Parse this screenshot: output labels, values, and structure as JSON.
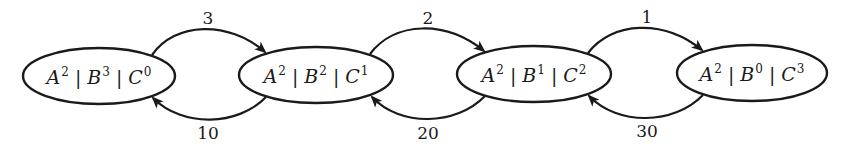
{
  "diagram": {
    "type": "state-transition-chain",
    "colors": {
      "stroke": "#1a1a1a",
      "background": "#ffffff"
    },
    "nodes": [
      {
        "id": "s0",
        "cx": 99,
        "cy": 76,
        "rx": 76,
        "ry": 28,
        "terms": [
          {
            "var": "A",
            "exp": "2"
          },
          {
            "var": "B",
            "exp": "3"
          },
          {
            "var": "C",
            "exp": "0"
          }
        ],
        "separator": "|"
      },
      {
        "id": "s1",
        "cx": 316,
        "cy": 75,
        "rx": 77,
        "ry": 28,
        "terms": [
          {
            "var": "A",
            "exp": "2"
          },
          {
            "var": "B",
            "exp": "2"
          },
          {
            "var": "C",
            "exp": "1"
          }
        ],
        "separator": "|"
      },
      {
        "id": "s2",
        "cx": 534,
        "cy": 74,
        "rx": 77,
        "ry": 28,
        "terms": [
          {
            "var": "A",
            "exp": "2"
          },
          {
            "var": "B",
            "exp": "1"
          },
          {
            "var": "C",
            "exp": "2"
          }
        ],
        "separator": "|"
      },
      {
        "id": "s3",
        "cx": 752,
        "cy": 73,
        "rx": 75,
        "ry": 28,
        "terms": [
          {
            "var": "A",
            "exp": "2"
          },
          {
            "var": "B",
            "exp": "0"
          },
          {
            "var": "C",
            "exp": "3"
          }
        ],
        "separator": "|"
      }
    ],
    "edges": [
      {
        "from": "s0",
        "to": "s1",
        "label": "3",
        "direction": "forward",
        "label_x": 208,
        "label_y": 18,
        "path": "M152,55 C175,22 228,20 265,52"
      },
      {
        "from": "s1",
        "to": "s0",
        "label": "10",
        "direction": "backward",
        "label_x": 208,
        "label_y": 133,
        "path": "M266,97 C238,126 183,128 153,98"
      },
      {
        "from": "s1",
        "to": "s2",
        "label": "2",
        "direction": "forward",
        "label_x": 428,
        "label_y": 18,
        "path": "M370,54 C395,21 446,20 484,51"
      },
      {
        "from": "s2",
        "to": "s1",
        "label": "20",
        "direction": "backward",
        "label_x": 428,
        "label_y": 133,
        "path": "M485,96 C456,126 400,127 372,97"
      },
      {
        "from": "s2",
        "to": "s3",
        "label": "1",
        "direction": "forward",
        "label_x": 647,
        "label_y": 17,
        "path": "M588,53 C612,21 664,19 702,50"
      },
      {
        "from": "s3",
        "to": "s2",
        "label": "30",
        "direction": "backward",
        "label_x": 647,
        "label_y": 131,
        "path": "M703,95 C674,125 618,126 589,96"
      }
    ]
  }
}
